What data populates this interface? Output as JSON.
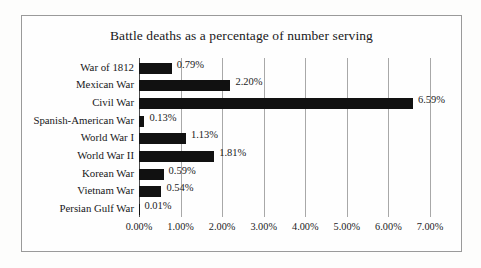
{
  "figure": {
    "title": "Battle deaths as a percentage of number serving",
    "border_color": "#9a9a9a",
    "background_color": "#fefefe"
  },
  "chart_data": {
    "type": "bar",
    "orientation": "horizontal",
    "title": "Battle deaths as a percentage of number serving",
    "xlabel": "",
    "ylabel": "",
    "categories": [
      "War of 1812",
      "Mexican War",
      "Civil War",
      "Spanish-American War",
      "World War I",
      "World War II",
      "Korean War",
      "Vietnam War",
      "Persian Gulf War"
    ],
    "values": [
      0.79,
      2.2,
      6.59,
      0.13,
      1.13,
      1.81,
      0.59,
      0.54,
      0.01
    ],
    "value_labels": [
      "0.79%",
      "2.20%",
      "6.59%",
      "0.13%",
      "1.13%",
      "1.81%",
      "0.59%",
      "0.54%",
      "0.01%"
    ],
    "xlim": [
      0,
      7
    ],
    "xticks": [
      0,
      1,
      2,
      3,
      4,
      5,
      6,
      7
    ],
    "xtick_labels": [
      "0.00%",
      "1.00%",
      "2.00%",
      "3.00%",
      "4.00%",
      "5.00%",
      "6.00%",
      "7.00%"
    ],
    "grid": true,
    "grid_axis": "x",
    "legend": false,
    "bar_color": "#111111",
    "gridline_color": "#a8a8a8",
    "axis_color": "#4c4c4c",
    "units": "percent"
  }
}
